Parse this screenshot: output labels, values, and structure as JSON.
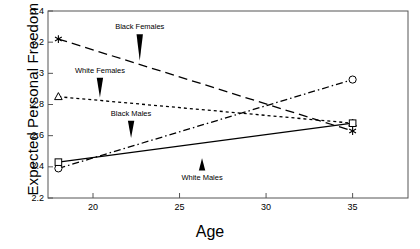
{
  "chart_data": {
    "type": "line",
    "title": "",
    "xlabel": "Age",
    "ylabel": "Expected Personal Freedom",
    "xlim": [
      17.4,
      38.2
    ],
    "ylim": [
      2.2,
      3.4
    ],
    "xticks": [
      20,
      25,
      30,
      35
    ],
    "yticks": [
      2.2,
      2.4,
      2.6,
      2.8,
      3.0,
      3.2,
      3.4
    ],
    "ytick_labels": [
      "2.2",
      "2.4",
      "2.6",
      "2.8",
      "3",
      "3.2",
      "3.4"
    ],
    "xtick_labels": [
      "20",
      "25",
      "30",
      "35"
    ],
    "grid": false,
    "legend": "inline-annotations",
    "x": [
      18,
      35
    ],
    "series": [
      {
        "name": "Black Females",
        "values": [
          3.22,
          2.63
        ],
        "marker": "asterisk",
        "linestyle": "long-dash",
        "color": "#000000"
      },
      {
        "name": "White Females",
        "values": [
          2.85,
          2.68
        ],
        "marker": "triangle",
        "linestyle": "short-dash",
        "color": "#000000"
      },
      {
        "name": "Black Males",
        "values": [
          2.39,
          2.96
        ],
        "marker": "circle",
        "linestyle": "dash-dot",
        "color": "#000000"
      },
      {
        "name": "White Males",
        "values": [
          2.43,
          2.68
        ],
        "marker": "square",
        "linestyle": "solid",
        "color": "#000000"
      }
    ],
    "annotations": [
      {
        "text": "Black Females",
        "label_x": 22.7,
        "label_y": 3.29,
        "arrow_to_y": 3.08
      },
      {
        "text": "White Females",
        "label_x": 20.4,
        "label_y": 3.01,
        "arrow_to_y": 2.845
      },
      {
        "text": "Black Males",
        "label_x": 22.2,
        "label_y": 2.735,
        "arrow_to_y": 2.585
      },
      {
        "text": "White Males",
        "label_x": 26.3,
        "label_y": 2.325,
        "arrow_to_y": 2.455
      }
    ]
  },
  "axes": {
    "frame_color": "#555555",
    "line_color": "#000000"
  }
}
